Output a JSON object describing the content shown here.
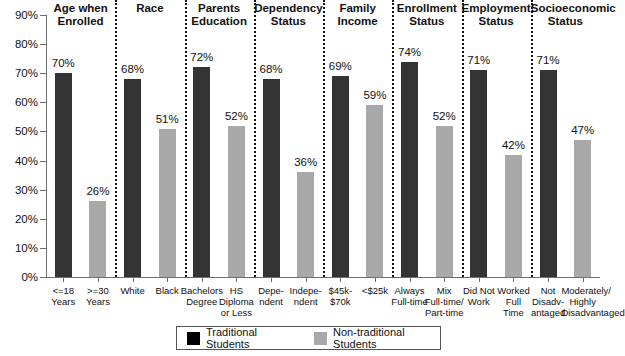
{
  "chart_data": {
    "type": "bar",
    "title": "",
    "xlabel": "",
    "ylabel": "",
    "ylim": [
      0,
      90
    ],
    "ytick_labels": [
      "90%",
      "80%",
      "70%",
      "60%",
      "50%",
      "40%",
      "30%",
      "20%",
      "10%",
      "0%"
    ],
    "ytick_values": [
      90,
      80,
      70,
      60,
      50,
      40,
      30,
      20,
      10,
      0
    ],
    "grid": false,
    "legend_position": "bottom-center",
    "legend": [
      "Traditional Students",
      "Non-traditional Students"
    ],
    "colors": {
      "traditional": "#333333",
      "non_traditional": "#a9a9a9",
      "legend_traditional": "#000000",
      "axis": "#6f6f6f",
      "text": "#111111",
      "background": "#ffffff"
    },
    "groups": [
      {
        "name": "Age when Enrolled",
        "heading_lines": [
          "Age when",
          "Enrolled"
        ],
        "bars": [
          {
            "label_lines": [
              "<=18",
              "Years"
            ],
            "value": 70,
            "value_label": "70%",
            "series": "traditional"
          },
          {
            "label_lines": [
              ">=30",
              "Years"
            ],
            "value": 26,
            "value_label": "26%",
            "series": "non_traditional"
          }
        ]
      },
      {
        "name": "Race",
        "heading_lines": [
          "Race"
        ],
        "bars": [
          {
            "label_lines": [
              "White"
            ],
            "value": 68,
            "value_label": "68%",
            "series": "traditional"
          },
          {
            "label_lines": [
              "Black"
            ],
            "value": 51,
            "value_label": "51%",
            "series": "non_traditional"
          }
        ]
      },
      {
        "name": "Parents Education",
        "heading_lines": [
          "Parents",
          "Education"
        ],
        "bars": [
          {
            "label_lines": [
              "Bachelors",
              "Degree"
            ],
            "value": 72,
            "value_label": "72%",
            "series": "traditional"
          },
          {
            "label_lines": [
              "HS",
              "Diploma",
              "or Less"
            ],
            "value": 52,
            "value_label": "52%",
            "series": "non_traditional"
          }
        ]
      },
      {
        "name": "Dependency Status",
        "heading_lines": [
          "Dependency",
          "Status"
        ],
        "bars": [
          {
            "label_lines": [
              "Depe-",
              "ndent"
            ],
            "value": 68,
            "value_label": "68%",
            "series": "traditional"
          },
          {
            "label_lines": [
              "Indepe-",
              "ndent"
            ],
            "value": 36,
            "value_label": "36%",
            "series": "non_traditional"
          }
        ]
      },
      {
        "name": "Family Income",
        "heading_lines": [
          "Family",
          "Income"
        ],
        "bars": [
          {
            "label_lines": [
              "$45k-",
              "$70k"
            ],
            "value": 69,
            "value_label": "69%",
            "series": "traditional"
          },
          {
            "label_lines": [
              "<$25k"
            ],
            "value": 59,
            "value_label": "59%",
            "series": "non_traditional"
          }
        ]
      },
      {
        "name": "Enrollment Status",
        "heading_lines": [
          "Enrollment",
          "Status"
        ],
        "bars": [
          {
            "label_lines": [
              "Always",
              "Full-time"
            ],
            "value": 74,
            "value_label": "74%",
            "series": "traditional"
          },
          {
            "label_lines": [
              "Mix",
              "Full-time/",
              "Part-time"
            ],
            "value": 52,
            "value_label": "52%",
            "series": "non_traditional"
          }
        ]
      },
      {
        "name": "Employment Status",
        "heading_lines": [
          "Employment",
          "Status"
        ],
        "bars": [
          {
            "label_lines": [
              "Did Not",
              "Work"
            ],
            "value": 71,
            "value_label": "71%",
            "series": "traditional"
          },
          {
            "label_lines": [
              "Worked",
              "Full",
              "Time"
            ],
            "value": 42,
            "value_label": "42%",
            "series": "non_traditional"
          }
        ]
      },
      {
        "name": "Socioeconomic Status",
        "heading_lines": [
          "Socioeconomic",
          "Status"
        ],
        "bars": [
          {
            "label_lines": [
              "Not",
              "Disadv-",
              "antaged"
            ],
            "value": 71,
            "value_label": "71%",
            "series": "traditional"
          },
          {
            "label_lines": [
              "Moderately/",
              "Highly",
              "Disadvantaged"
            ],
            "value": 47,
            "value_label": "47%",
            "series": "non_traditional"
          }
        ]
      }
    ]
  }
}
